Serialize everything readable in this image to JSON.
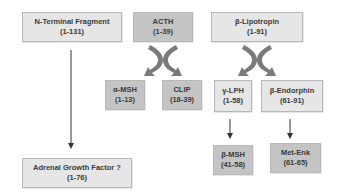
{
  "diagram": {
    "nodes": [
      {
        "id": "n_terminal",
        "name": "N-Terminal Fragment",
        "range": "(1-131)"
      },
      {
        "id": "acth",
        "name": "ACTH",
        "range": "(1-39)"
      },
      {
        "id": "b_lipotropin",
        "name": "β-Lipotropin",
        "range": "(1-91)"
      },
      {
        "id": "a_msh",
        "name": "α-MSH",
        "range": "(1-13)"
      },
      {
        "id": "clip",
        "name": "CLIP",
        "range": "(18-39)"
      },
      {
        "id": "g_lph",
        "name": "γ-LPH",
        "range": "(1-58)"
      },
      {
        "id": "b_endorphin",
        "name": "β-Endorphin",
        "range": "(61-91)"
      },
      {
        "id": "adrenal_gf",
        "name": "Adrenal Growth Factor ?",
        "range": "(1-76)"
      },
      {
        "id": "b_msh",
        "name": "β-MSH",
        "range": "(41-58)"
      },
      {
        "id": "met_enk",
        "name": "Met-Enk",
        "range": "(61-65)"
      }
    ],
    "edges": [
      {
        "from": "n_terminal",
        "to": "adrenal_gf",
        "type": "arrow"
      },
      {
        "from": "acth",
        "to": [
          "a_msh",
          "clip"
        ],
        "type": "split-arrow"
      },
      {
        "from": "b_lipotropin",
        "to": [
          "g_lph",
          "b_endorphin"
        ],
        "type": "split-arrow"
      },
      {
        "from": "g_lph",
        "to": "b_msh",
        "type": "arrow"
      },
      {
        "from": "b_endorphin",
        "to": "met_enk",
        "type": "arrow"
      }
    ],
    "colors": {
      "light_box": "#e6e6e6",
      "dark_box": "#c4c4c4",
      "split_arrow": "#7a7a7a",
      "line": "#333333"
    }
  }
}
